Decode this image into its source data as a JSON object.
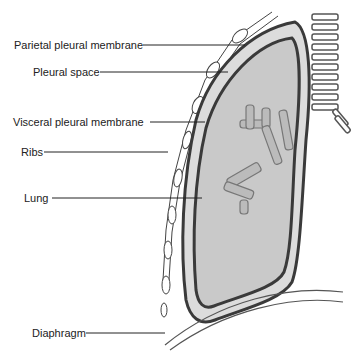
{
  "diagram": {
    "labels": [
      {
        "id": "parietal",
        "text": "Parietal pleural membrane",
        "x": 14,
        "y": 40
      },
      {
        "id": "pleural-space",
        "text": "Pleural space",
        "x": 33,
        "y": 66
      },
      {
        "id": "visceral",
        "text": "Visceral pleural membrane",
        "x": 13,
        "y": 117
      },
      {
        "id": "ribs",
        "text": "Ribs",
        "x": 21,
        "y": 146
      },
      {
        "id": "lung",
        "text": "Lung",
        "x": 24,
        "y": 193
      },
      {
        "id": "diaphragm",
        "text": "Diaphragm",
        "x": 32,
        "y": 327
      }
    ],
    "colors": {
      "lung_fill": "#c9c9c9",
      "pleural_space": "#dcdcdc",
      "membrane": "#3a3a3a",
      "bronchi": "#8a8a8a"
    }
  }
}
